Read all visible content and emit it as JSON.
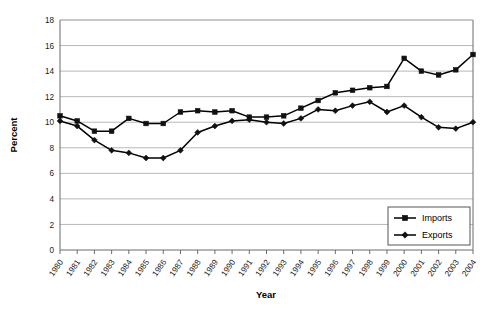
{
  "chart_data": {
    "type": "line",
    "title": "",
    "xlabel": "Year",
    "ylabel": "Percent",
    "ylim": [
      0,
      18
    ],
    "ytick_step": 2,
    "grid": true,
    "legend_position": "bottom-right",
    "categories": [
      "1980",
      "1981",
      "1982",
      "1983",
      "1984",
      "1985",
      "1986",
      "1987",
      "1988",
      "1989",
      "1990",
      "1991",
      "1992",
      "1993",
      "1994",
      "1995",
      "1996",
      "1997",
      "1998",
      "1999",
      "2000",
      "2001",
      "2002",
      "2003",
      "2004"
    ],
    "yticks": [
      "0",
      "2",
      "4",
      "6",
      "8",
      "10",
      "12",
      "14",
      "16",
      "18"
    ],
    "series": [
      {
        "name": "Imports",
        "marker": "square",
        "color": "#000000",
        "values": [
          10.5,
          10.1,
          9.3,
          9.3,
          10.3,
          9.9,
          9.9,
          10.8,
          10.9,
          10.8,
          10.9,
          10.4,
          10.4,
          10.5,
          11.1,
          11.7,
          12.3,
          12.5,
          12.7,
          12.8,
          15.0,
          14.0,
          13.7,
          14.1,
          15.3
        ]
      },
      {
        "name": "Exports",
        "marker": "diamond",
        "color": "#000000",
        "values": [
          10.1,
          9.7,
          8.6,
          7.8,
          7.6,
          7.2,
          7.2,
          7.8,
          9.2,
          9.7,
          10.1,
          10.2,
          10.0,
          9.9,
          10.3,
          11.0,
          10.9,
          11.3,
          11.6,
          10.8,
          11.3,
          10.4,
          9.6,
          9.5,
          10.0
        ]
      }
    ],
    "legend": [
      {
        "label": "Imports",
        "marker": "square"
      },
      {
        "label": "Exports",
        "marker": "diamond"
      }
    ]
  }
}
